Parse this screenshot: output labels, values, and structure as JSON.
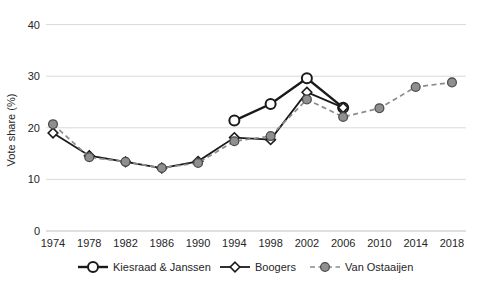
{
  "chart_data": {
    "type": "line",
    "title": "",
    "xlabel": "",
    "ylabel": "Vote share (%)",
    "ylim": [
      0,
      40
    ],
    "yticks": [
      0,
      10,
      20,
      30,
      40
    ],
    "grid": "horizontal",
    "legend_position": "bottom",
    "categories": [
      "1974",
      "1978",
      "1982",
      "1986",
      "1990",
      "1994",
      "1998",
      "2002",
      "2006",
      "2010",
      "2014",
      "2018"
    ],
    "series": [
      {
        "name": "Kiesraad & Janssen",
        "marker": "open-circle",
        "line": "solid",
        "color": "#1a1a1a",
        "marker_fill": "#ffffff",
        "marker_stroke": "#1a1a1a",
        "values": [
          null,
          null,
          null,
          null,
          null,
          21.4,
          24.6,
          29.6,
          23.9,
          null,
          null,
          null
        ]
      },
      {
        "name": "Boogers",
        "marker": "open-diamond",
        "line": "solid",
        "color": "#1a1a1a",
        "marker_fill": "#ffffff",
        "marker_stroke": "#1a1a1a",
        "values": [
          19.0,
          14.6,
          13.4,
          12.2,
          13.5,
          18.1,
          17.7,
          26.9,
          23.9,
          null,
          null,
          null
        ]
      },
      {
        "name": "Van Ostaaijen",
        "marker": "filled-circle",
        "line": "dashed",
        "color": "#8c8c8c",
        "marker_fill": "#8f8f8f",
        "marker_stroke": "#4d4d4d",
        "values": [
          20.7,
          14.3,
          13.4,
          12.2,
          13.2,
          17.4,
          18.4,
          25.5,
          22.1,
          23.8,
          27.9,
          28.8
        ]
      }
    ],
    "colors": {
      "gridline": "#d9d9d9",
      "baseline": "#bfbfbf",
      "text": "#262626"
    }
  }
}
